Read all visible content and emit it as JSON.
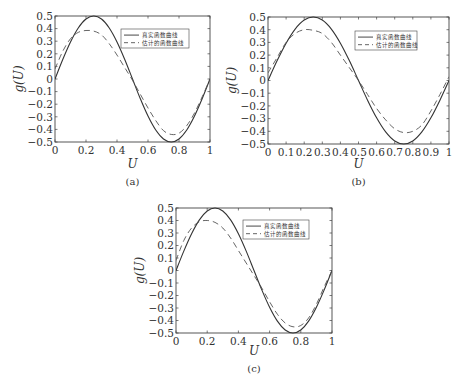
{
  "legend": {
    "true_label": "真实函数曲线",
    "estimated_label": "估计的函数曲线"
  },
  "axis": {
    "xlabel": "U",
    "ylabel": "g(U)"
  },
  "colors": {
    "true_line": "#333333",
    "estimated_line": "#555555",
    "frame": "#444444"
  },
  "chart_data": [
    {
      "type": "line",
      "caption": "(a)",
      "xlabel": "U",
      "ylabel": "g(U)",
      "xlim": [
        0,
        1
      ],
      "ylim": [
        -0.5,
        0.5
      ],
      "xticks": [
        "0",
        "0.2",
        "0.4",
        "0.6",
        "0.8",
        "1"
      ],
      "yticks": [
        "0.5",
        "0.4",
        "0.3",
        "0.2",
        "0.1",
        "0",
        "−0.1",
        "−0.2",
        "−0.3",
        "−0.4",
        "−0.5"
      ],
      "grid": false,
      "legend_position": "upper right",
      "series": [
        {
          "name": "真实函数曲线",
          "style": "solid",
          "x": [
            0,
            0.05,
            0.1,
            0.15,
            0.2,
            0.25,
            0.3,
            0.35,
            0.4,
            0.45,
            0.5,
            0.55,
            0.6,
            0.65,
            0.7,
            0.75,
            0.8,
            0.85,
            0.9,
            0.95,
            1.0
          ],
          "y": [
            0,
            0.155,
            0.294,
            0.405,
            0.476,
            0.5,
            0.476,
            0.405,
            0.294,
            0.155,
            0,
            -0.155,
            -0.294,
            -0.405,
            -0.476,
            -0.5,
            -0.476,
            -0.405,
            -0.294,
            -0.155,
            0
          ]
        },
        {
          "name": "估计的函数曲线",
          "style": "dashed",
          "x": [
            0,
            0.05,
            0.1,
            0.15,
            0.2,
            0.25,
            0.3,
            0.35,
            0.4,
            0.45,
            0.5,
            0.55,
            0.6,
            0.65,
            0.7,
            0.75,
            0.8,
            0.85,
            0.9,
            0.95,
            1.0
          ],
          "y": [
            0.08,
            0.22,
            0.32,
            0.37,
            0.385,
            0.38,
            0.35,
            0.28,
            0.19,
            0.09,
            -0.01,
            -0.12,
            -0.23,
            -0.33,
            -0.41,
            -0.44,
            -0.43,
            -0.37,
            -0.27,
            -0.14,
            0
          ]
        }
      ]
    },
    {
      "type": "line",
      "caption": "(b)",
      "xlabel": "U",
      "ylabel": "g(U)",
      "xlim": [
        0,
        1
      ],
      "ylim": [
        -0.5,
        0.5
      ],
      "xticks": [
        "0",
        "0.1",
        "0.2",
        "0.3",
        "0.4",
        "0.5",
        "0.6",
        "0.7",
        "0.8",
        "0.9",
        "1"
      ],
      "yticks": [
        "0.5",
        "0.4",
        "0.3",
        "0.2",
        "0.1",
        "0",
        "−0.1",
        "−0.2",
        "−0.3",
        "−0.4",
        "−0.5"
      ],
      "grid": false,
      "legend_position": "upper right",
      "series": [
        {
          "name": "真实函数曲线",
          "style": "solid",
          "x": [
            0,
            0.05,
            0.1,
            0.15,
            0.2,
            0.25,
            0.3,
            0.35,
            0.4,
            0.45,
            0.5,
            0.55,
            0.6,
            0.65,
            0.7,
            0.75,
            0.8,
            0.85,
            0.9,
            0.95,
            1.0
          ],
          "y": [
            0,
            0.155,
            0.294,
            0.405,
            0.476,
            0.5,
            0.476,
            0.405,
            0.294,
            0.155,
            0,
            -0.155,
            -0.294,
            -0.405,
            -0.476,
            -0.5,
            -0.476,
            -0.405,
            -0.294,
            -0.155,
            0
          ]
        },
        {
          "name": "估计的函数曲线",
          "style": "dashed",
          "x": [
            0,
            0.05,
            0.1,
            0.15,
            0.2,
            0.25,
            0.3,
            0.35,
            0.4,
            0.45,
            0.5,
            0.55,
            0.6,
            0.65,
            0.7,
            0.75,
            0.8,
            0.85,
            0.9,
            0.95,
            1.0
          ],
          "y": [
            0.06,
            0.18,
            0.3,
            0.37,
            0.4,
            0.395,
            0.37,
            0.3,
            0.2,
            0.1,
            0.0,
            -0.11,
            -0.22,
            -0.31,
            -0.38,
            -0.41,
            -0.4,
            -0.35,
            -0.24,
            -0.11,
            0.03
          ]
        }
      ]
    },
    {
      "type": "line",
      "caption": "(c)",
      "xlabel": "U",
      "ylabel": "g(U)",
      "xlim": [
        0,
        1
      ],
      "ylim": [
        -0.5,
        0.5
      ],
      "xticks": [
        "0",
        "0.2",
        "0.4",
        "0.6",
        "0.8",
        "1"
      ],
      "yticks": [
        "0.5",
        "0.4",
        "0.3",
        "0.2",
        "0.1",
        "0",
        "−0.1",
        "−0.2",
        "−0.3",
        "−0.4",
        "−0.5"
      ],
      "grid": false,
      "legend_position": "upper right",
      "series": [
        {
          "name": "真实函数曲线",
          "style": "solid",
          "x": [
            0,
            0.05,
            0.1,
            0.15,
            0.2,
            0.25,
            0.3,
            0.35,
            0.4,
            0.45,
            0.5,
            0.55,
            0.6,
            0.65,
            0.7,
            0.75,
            0.8,
            0.85,
            0.9,
            0.95,
            1.0
          ],
          "y": [
            0,
            0.155,
            0.294,
            0.405,
            0.476,
            0.5,
            0.476,
            0.405,
            0.294,
            0.155,
            0,
            -0.155,
            -0.294,
            -0.405,
            -0.476,
            -0.5,
            -0.476,
            -0.405,
            -0.294,
            -0.155,
            0
          ]
        },
        {
          "name": "估计的函数曲线",
          "style": "dashed",
          "x": [
            0,
            0.05,
            0.1,
            0.15,
            0.2,
            0.25,
            0.3,
            0.35,
            0.4,
            0.45,
            0.5,
            0.55,
            0.6,
            0.65,
            0.7,
            0.75,
            0.8,
            0.85,
            0.9,
            0.95,
            1.0
          ],
          "y": [
            0.08,
            0.24,
            0.34,
            0.39,
            0.4,
            0.385,
            0.34,
            0.26,
            0.16,
            0.06,
            -0.04,
            -0.14,
            -0.25,
            -0.35,
            -0.42,
            -0.45,
            -0.44,
            -0.38,
            -0.27,
            -0.13,
            0
          ]
        }
      ]
    }
  ]
}
